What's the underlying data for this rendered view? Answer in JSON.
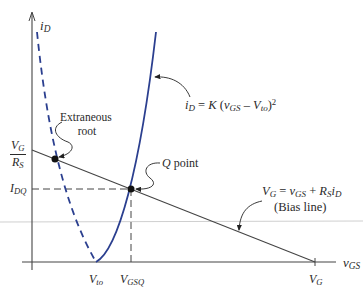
{
  "figure": {
    "colors": {
      "curve": "#2b3f8f",
      "axis": "#444444",
      "line": "#444444",
      "text": "#2a2a2a",
      "artifact_line": "#c8c8c8"
    },
    "axes": {
      "y_label": {
        "var": "i",
        "sub": "D"
      },
      "x_label": {
        "var": "v",
        "sub": "GS"
      }
    },
    "y_ticks": {
      "vg_over_rs": {
        "num_var": "V",
        "num_sub": "G",
        "den_var": "R",
        "den_sub": "S"
      },
      "idq": {
        "var": "I",
        "sub": "DQ"
      }
    },
    "x_ticks": {
      "vto": {
        "var": "V",
        "sub": "to"
      },
      "vgsq": {
        "var": "V",
        "sub": "GSQ"
      },
      "vg": {
        "var": "V",
        "sub": "G"
      }
    },
    "annotations": {
      "extraneous_root": {
        "line1": "Extraneous",
        "line2": "root"
      },
      "q_point": {
        "var": "Q",
        "text": " point"
      },
      "parabola_eq": {
        "lhs_var": "i",
        "lhs_sub": "D",
        "eq": " = ",
        "k": "K",
        "open": " (",
        "v": "v",
        "v_sub": "GS",
        "minus": " – ",
        "vto": "V",
        "vto_sub": "to",
        "close": ")",
        "exp": "2"
      },
      "bias_eq": {
        "vg": "V",
        "vg_sub": "G",
        "eq": " = ",
        "v": "v",
        "v_sub": "GS",
        "plus": " + ",
        "r": "R",
        "r_sub": "S",
        "i": "i",
        "i_sub": "D"
      },
      "bias_caption": "(Bias line)"
    }
  }
}
